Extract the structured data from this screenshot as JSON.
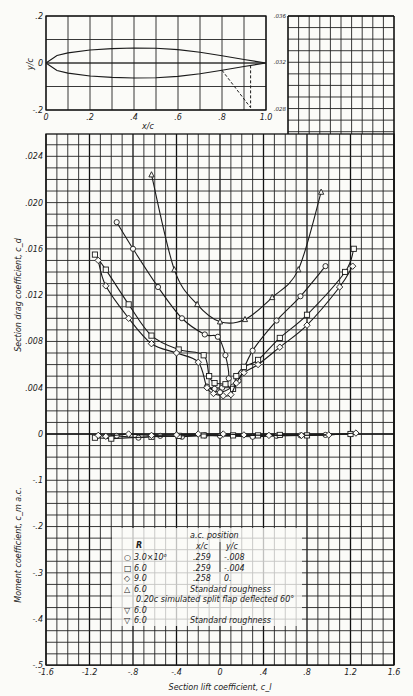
{
  "chart_data": [
    {
      "id": "airfoil",
      "type": "line",
      "title": "",
      "xlabel": "x/c",
      "ylabel": "y/c",
      "xlim": [
        0,
        1.0
      ],
      "ylim": [
        -0.2,
        0.2
      ],
      "xticks": [
        "0",
        ".2",
        ".4",
        ".6",
        ".8",
        "1.0"
      ],
      "yticks": [
        ".2",
        "0",
        "-.2"
      ],
      "right_ticks": [
        ".036",
        ".032",
        ".028"
      ],
      "upper_surface": [
        [
          0,
          0
        ],
        [
          0.05,
          0.032
        ],
        [
          0.1,
          0.043
        ],
        [
          0.2,
          0.055
        ],
        [
          0.3,
          0.061
        ],
        [
          0.4,
          0.064
        ],
        [
          0.5,
          0.063
        ],
        [
          0.6,
          0.057
        ],
        [
          0.7,
          0.046
        ],
        [
          0.8,
          0.031
        ],
        [
          0.9,
          0.015
        ],
        [
          1.0,
          0.0
        ]
      ],
      "lower_surface": [
        [
          0,
          0
        ],
        [
          0.05,
          -0.032
        ],
        [
          0.1,
          -0.043
        ],
        [
          0.2,
          -0.055
        ],
        [
          0.3,
          -0.061
        ],
        [
          0.4,
          -0.064
        ],
        [
          0.5,
          -0.063
        ],
        [
          0.6,
          -0.057
        ],
        [
          0.7,
          -0.046
        ],
        [
          0.8,
          -0.031
        ],
        [
          0.9,
          -0.015
        ],
        [
          1.0,
          0.0
        ]
      ],
      "flap_annotation": {
        "hinge_x": 0.8,
        "tip": [
          0.93,
          -0.19
        ],
        "label": "0.20c split flap deflected 60°"
      }
    },
    {
      "id": "drag",
      "type": "line",
      "xlabel": "Section lift coefficient, c_l",
      "ylabel": "Section drag coefficient, c_d",
      "xlim": [
        -1.6,
        1.6
      ],
      "ylim": [
        0,
        0.026
      ],
      "yticks": [
        "0",
        ".004",
        ".008",
        ".012",
        ".016",
        ".020",
        ".024"
      ],
      "grid": true,
      "series": [
        {
          "name": "R = 3.0×10^6",
          "marker": "circle",
          "points": [
            [
              -0.95,
              0.0183
            ],
            [
              -0.8,
              0.016
            ],
            [
              -0.57,
              0.0127
            ],
            [
              -0.35,
              0.01
            ],
            [
              -0.14,
              0.0086
            ],
            [
              -0.02,
              0.0084
            ],
            [
              0.05,
              0.0068
            ],
            [
              0.08,
              0.0048
            ],
            [
              0.02,
              0.004
            ],
            [
              -0.05,
              0.0039
            ],
            [
              -0.12,
              0.0041
            ],
            [
              0.0,
              0.0036
            ],
            [
              0.12,
              0.0041
            ],
            [
              0.17,
              0.0046
            ],
            [
              0.3,
              0.0072
            ],
            [
              0.52,
              0.0098
            ],
            [
              0.74,
              0.0119
            ],
            [
              0.97,
              0.0145
            ]
          ]
        },
        {
          "name": "R = 6.0×10^6",
          "marker": "square",
          "points": [
            [
              -1.15,
              0.0155
            ],
            [
              -1.05,
              0.0142
            ],
            [
              -0.84,
              0.0112
            ],
            [
              -0.63,
              0.0085
            ],
            [
              -0.38,
              0.0073
            ],
            [
              -0.15,
              0.0068
            ],
            [
              -0.1,
              0.005
            ],
            [
              -0.05,
              0.0044
            ],
            [
              0.05,
              0.0043
            ],
            [
              0.12,
              0.0039
            ],
            [
              0.15,
              0.005
            ],
            [
              0.22,
              0.0058
            ],
            [
              0.35,
              0.0064
            ],
            [
              0.55,
              0.0083
            ],
            [
              0.8,
              0.0103
            ],
            [
              1.15,
              0.014
            ],
            [
              1.23,
              0.016
            ]
          ]
        },
        {
          "name": "R = 9.0×10^6",
          "marker": "diamond",
          "points": [
            [
              -1.12,
              0.015
            ],
            [
              -1.05,
              0.0128
            ],
            [
              -0.84,
              0.01
            ],
            [
              -0.63,
              0.0078
            ],
            [
              -0.4,
              0.007
            ],
            [
              -0.2,
              0.0062
            ],
            [
              -0.12,
              0.004
            ],
            [
              -0.06,
              0.0035
            ],
            [
              0.03,
              0.0033
            ],
            [
              0.1,
              0.0034
            ],
            [
              0.15,
              0.0044
            ],
            [
              0.22,
              0.0053
            ],
            [
              0.35,
              0.006
            ],
            [
              0.55,
              0.0075
            ],
            [
              0.8,
              0.0094
            ],
            [
              1.1,
              0.0127
            ],
            [
              1.22,
              0.0145
            ]
          ]
        },
        {
          "name": "R = 6.0×10^6, Standard roughness",
          "marker": "triangle",
          "points": [
            [
              -0.63,
              0.0224
            ],
            [
              -0.42,
              0.0142
            ],
            [
              -0.21,
              0.0112
            ],
            [
              0.0,
              0.0097
            ],
            [
              0.23,
              0.0099
            ],
            [
              0.48,
              0.0118
            ],
            [
              0.72,
              0.0142
            ],
            [
              0.93,
              0.0209
            ]
          ]
        }
      ]
    },
    {
      "id": "moment",
      "type": "line",
      "xlabel": "Section lift coefficient, c_l",
      "ylabel": "Moment coefficient, c_m a.c.",
      "xlim": [
        -1.6,
        1.6
      ],
      "ylim": [
        -0.5,
        0
      ],
      "xticks": [
        "-1.6",
        "-1.2",
        "-.8",
        "-.4",
        "0",
        ".4",
        ".8",
        "1.2",
        "1.6"
      ],
      "yticks": [
        "0",
        "-.1",
        "-.2",
        "-.3",
        "-.4",
        "-.5"
      ],
      "grid": true,
      "series": [
        {
          "name": "R = 3.0×10^6",
          "marker": "circle",
          "points": [
            [
              -0.95,
              -0.004
            ],
            [
              -0.75,
              -0.008
            ],
            [
              -0.55,
              -0.004
            ],
            [
              -0.35,
              -0.006
            ],
            [
              -0.14,
              -0.003
            ],
            [
              0.0,
              -0.004
            ],
            [
              0.3,
              -0.006
            ],
            [
              0.52,
              -0.004
            ],
            [
              0.74,
              -0.003
            ],
            [
              0.97,
              -0.002
            ]
          ]
        },
        {
          "name": "R = 6.0×10^6",
          "marker": "square",
          "points": [
            [
              -1.15,
              -0.008
            ],
            [
              -1.0,
              -0.01
            ],
            [
              -0.63,
              -0.006
            ],
            [
              -0.38,
              -0.004
            ],
            [
              -0.15,
              -0.003
            ],
            [
              0.12,
              -0.003
            ],
            [
              0.35,
              -0.003
            ],
            [
              0.55,
              -0.002
            ],
            [
              0.8,
              -0.003
            ],
            [
              1.2,
              0.0
            ]
          ]
        },
        {
          "name": "R = 9.0×10^6",
          "marker": "diamond",
          "points": [
            [
              -1.12,
              -0.003
            ],
            [
              -1.05,
              -0.005
            ],
            [
              -0.84,
              0.0
            ],
            [
              -0.63,
              -0.003
            ],
            [
              -0.4,
              -0.002
            ],
            [
              -0.2,
              0.0
            ],
            [
              0.03,
              0.0
            ],
            [
              0.22,
              -0.002
            ],
            [
              0.45,
              -0.003
            ],
            [
              0.75,
              -0.003
            ],
            [
              1.0,
              -0.002
            ],
            [
              1.25,
              0.002
            ]
          ]
        }
      ]
    }
  ],
  "legend": {
    "header_R": "R",
    "header_ac": "a.c. position",
    "header_xc": "x/c",
    "header_yc": "y/c",
    "rows": [
      {
        "symbol": "○",
        "R": "3.0×10⁶",
        "xc": ".259",
        "yc": "-.008",
        "note": ""
      },
      {
        "symbol": "□",
        "R": "6.0",
        "xc": ".259",
        "yc": "-.004",
        "note": ""
      },
      {
        "symbol": "◇",
        "R": "9.0",
        "xc": ".258",
        "yc": "0.",
        "note": ""
      },
      {
        "symbol": "△",
        "R": "6.0",
        "xc": "",
        "yc": "",
        "note": "Standard roughness"
      }
    ],
    "flap_note": "0.20c simulated split flap deflected 60°",
    "flap_rows": [
      {
        "symbol": "▽",
        "R": "6.0",
        "note": ""
      },
      {
        "symbol": "▽",
        "R": "6.0",
        "note": "Standard roughness"
      }
    ]
  }
}
